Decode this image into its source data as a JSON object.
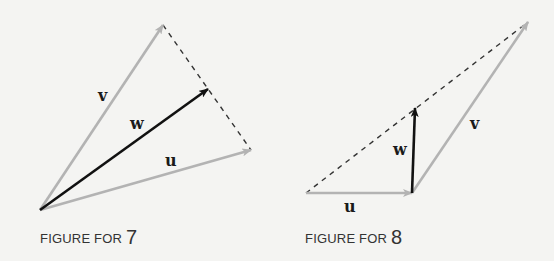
{
  "figures": [
    {
      "id": "figure-7",
      "caption_prefix": "FIGURE FOR ",
      "caption_number": "7",
      "labels": {
        "u": "u",
        "v": "v",
        "w": "w"
      },
      "vectors": [
        {
          "name": "v",
          "from": [
            40,
            210
          ],
          "to": [
            163,
            25
          ],
          "color": "#b3b3b3"
        },
        {
          "name": "u",
          "from": [
            40,
            210
          ],
          "to": [
            251,
            150
          ],
          "color": "#b3b3b3"
        },
        {
          "name": "w",
          "from": [
            40,
            210
          ],
          "to": [
            208,
            89
          ],
          "color": "#111111"
        }
      ],
      "dashed": [
        {
          "from": [
            163,
            25
          ],
          "to": [
            251,
            150
          ]
        }
      ]
    },
    {
      "id": "figure-8",
      "caption_prefix": "FIGURE FOR ",
      "caption_number": "8",
      "labels": {
        "u": "u",
        "v": "v",
        "w": "w"
      },
      "vectors": [
        {
          "name": "u",
          "from": [
            306,
            193
          ],
          "to": [
            412,
            193
          ],
          "color": "#b3b3b3"
        },
        {
          "name": "v",
          "from": [
            412,
            193
          ],
          "to": [
            528,
            22
          ],
          "color": "#b3b3b3"
        },
        {
          "name": "w",
          "from": [
            412,
            193
          ],
          "to": [
            415,
            108
          ],
          "color": "#111111"
        }
      ],
      "dashed": [
        {
          "from": [
            306,
            193
          ],
          "to": [
            528,
            22
          ]
        }
      ]
    }
  ],
  "colors": {
    "background": "#f4f4f2",
    "gray_vector": "#b3b3b3",
    "black_vector": "#111111",
    "dash": "#333333"
  }
}
